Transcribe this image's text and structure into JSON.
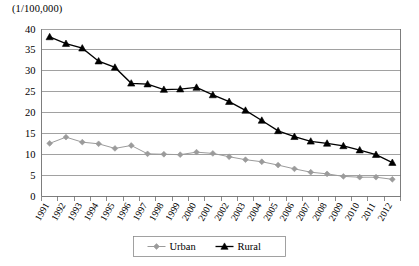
{
  "chart_data": {
    "type": "line",
    "title": "",
    "unit_label": "(1/100,000)",
    "xlabel": "",
    "ylabel": "",
    "ylim": [
      0,
      40
    ],
    "ytick_step": 5,
    "yticks": [
      0,
      5,
      10,
      15,
      20,
      25,
      30,
      35,
      40
    ],
    "grid": true,
    "legend_position": "bottom-center",
    "categories": [
      "1991",
      "1992",
      "1993",
      "1994",
      "1995",
      "1996",
      "1997",
      "1998",
      "1999",
      "2000",
      "2001",
      "2002",
      "2003",
      "2004",
      "2005",
      "2006",
      "2007",
      "2008",
      "2009",
      "2010",
      "2011",
      "2012"
    ],
    "series": [
      {
        "name": "Urban",
        "color": "#9b9b9b",
        "marker": "diamond",
        "values": [
          12.6,
          14.1,
          12.9,
          12.5,
          11.4,
          12.1,
          10.1,
          10.0,
          9.9,
          10.5,
          10.2,
          9.4,
          8.7,
          8.2,
          7.4,
          6.5,
          5.7,
          5.3,
          4.7,
          4.5,
          4.5,
          4.0
        ]
      },
      {
        "name": "Rural",
        "color": "#000000",
        "marker": "triangle",
        "values": [
          38.1,
          36.5,
          35.4,
          32.3,
          30.8,
          27.0,
          26.8,
          25.5,
          25.6,
          26.0,
          24.2,
          22.6,
          20.5,
          18.1,
          15.6,
          14.2,
          13.1,
          12.6,
          12.0,
          11.0,
          9.9,
          8.0
        ]
      }
    ]
  },
  "legend": {
    "items": [
      {
        "label": "Urban"
      },
      {
        "label": "Rural"
      }
    ]
  }
}
